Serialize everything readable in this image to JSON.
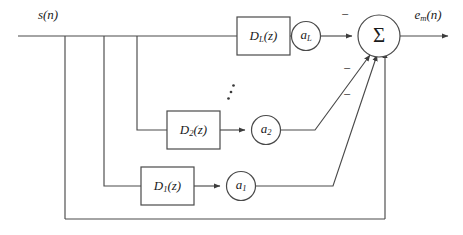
{
  "diagram": {
    "input_label": "s(n)",
    "output_label_base": "e",
    "output_label_sub": "m",
    "output_label_tail": "(n)",
    "summing_node_symbol": "Σ",
    "ellipsis_symbol": "vertical-dots",
    "sign_marks": [
      "−",
      "−",
      "−"
    ],
    "branches": [
      {
        "id": "branch-L",
        "delay_base": "D",
        "delay_sub": "L",
        "delay_tail": "(z)",
        "gain_base": "a",
        "gain_sub": "L",
        "sign": "−"
      },
      {
        "id": "branch-2",
        "delay_base": "D",
        "delay_sub": "2",
        "delay_tail": "(z)",
        "gain_base": "a",
        "gain_sub": "2",
        "sign": "−"
      },
      {
        "id": "branch-1",
        "delay_base": "D",
        "delay_sub": "1",
        "delay_tail": "(z)",
        "gain_base": "a",
        "gain_sub": "1",
        "sign": "−"
      }
    ],
    "colors": {
      "background": "#ffffff",
      "wire": "#4a4a4a",
      "text": "#1b1b1b",
      "arrow": "#3c3c3c"
    }
  }
}
